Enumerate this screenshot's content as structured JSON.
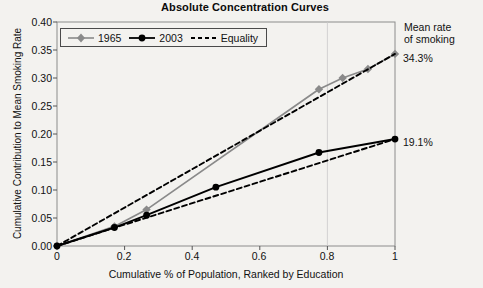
{
  "chart_data": {
    "type": "line",
    "title": "Absolute Concentration Curves",
    "xlabel": "Cumulative % of Population, Ranked by Education",
    "ylabel": "Cumulative Contribution to Mean Smoking Rate",
    "xlim": [
      0,
      1
    ],
    "ylim": [
      0,
      0.4
    ],
    "grid": false,
    "legend_position": "top-left",
    "xticks": [
      "0",
      "0.2",
      "0.4",
      "0.6",
      "0.8",
      "1"
    ],
    "xtick_values": [
      0,
      0.2,
      0.4,
      0.6,
      0.8,
      1
    ],
    "yticks": [
      "0.00",
      "0.05",
      "0.10",
      "0.15",
      "0.20",
      "0.25",
      "0.30",
      "0.35",
      "0.40"
    ],
    "ytick_values": [
      0,
      0.05,
      0.1,
      0.15,
      0.2,
      0.25,
      0.3,
      0.35,
      0.4
    ],
    "series": [
      {
        "name": "1965",
        "color": "#8a8a8a",
        "marker": "diamond",
        "style": "solid",
        "points": [
          {
            "x": 0.0,
            "y": 0.0
          },
          {
            "x": 0.17,
            "y": 0.035
          },
          {
            "x": 0.265,
            "y": 0.065
          },
          {
            "x": 0.775,
            "y": 0.28
          },
          {
            "x": 0.845,
            "y": 0.3
          },
          {
            "x": 0.92,
            "y": 0.316
          },
          {
            "x": 1.0,
            "y": 0.343
          }
        ]
      },
      {
        "name": "2003",
        "color": "#000000",
        "marker": "circle",
        "style": "solid",
        "points": [
          {
            "x": 0.0,
            "y": 0.0
          },
          {
            "x": 0.17,
            "y": 0.033
          },
          {
            "x": 0.265,
            "y": 0.055
          },
          {
            "x": 0.47,
            "y": 0.105
          },
          {
            "x": 0.775,
            "y": 0.167
          },
          {
            "x": 1.0,
            "y": 0.191
          }
        ]
      },
      {
        "name": "Equality",
        "color": "#000000",
        "marker": "none",
        "style": "dashed",
        "points": [
          {
            "x": 0.0,
            "y": 0.0
          },
          {
            "x": 1.0,
            "y": 0.343
          }
        ]
      },
      {
        "name": "Equality",
        "color": "#000000",
        "marker": "none",
        "style": "dashed",
        "points": [
          {
            "x": 0.0,
            "y": 0.0
          },
          {
            "x": 1.0,
            "y": 0.191
          }
        ]
      }
    ],
    "annotations": [
      {
        "name": "mean-rate-caption",
        "text": "Mean rate"
      },
      {
        "name": "mean-rate-caption-2",
        "text": "of smoking"
      },
      {
        "name": "value-1965",
        "text": "34.3%",
        "series": "1965",
        "at_x": 1.0,
        "at_y": 0.343
      },
      {
        "name": "value-2003",
        "text": "19.1%",
        "series": "2003",
        "at_x": 1.0,
        "at_y": 0.191
      }
    ]
  },
  "legend": {
    "items": [
      {
        "label": "1965"
      },
      {
        "label": "2003"
      },
      {
        "label": "Equality"
      }
    ]
  }
}
